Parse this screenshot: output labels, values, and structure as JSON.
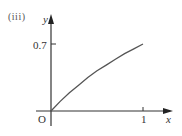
{
  "figure": {
    "part_label": "(iii)",
    "origin_label": "O"
  },
  "chart_data": {
    "type": "line",
    "title": "",
    "xlabel": "x",
    "ylabel": "y",
    "x_ticks": [
      "1"
    ],
    "y_ticks": [
      "0.7"
    ],
    "xlim": [
      0,
      1
    ],
    "ylim": [
      0,
      0.7
    ],
    "grid": false,
    "series": [
      {
        "name": "curve",
        "x": [
          0,
          0.1,
          0.2,
          0.3,
          0.4,
          0.5,
          0.6,
          0.7,
          0.8,
          0.9,
          1.0
        ],
        "y": [
          0,
          0.1,
          0.19,
          0.27,
          0.35,
          0.42,
          0.48,
          0.54,
          0.6,
          0.65,
          0.7
        ]
      }
    ]
  }
}
